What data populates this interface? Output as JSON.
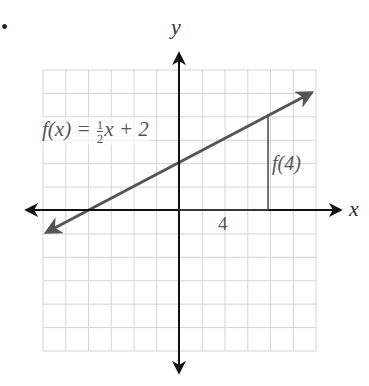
{
  "figure": {
    "bullet": "•",
    "axis_labels": {
      "x": "x",
      "y": "y"
    },
    "function_label": {
      "lhs": "f(x) = ",
      "frac_num": "1",
      "frac_den": "2",
      "rhs": "x + 2"
    },
    "value_label": "f(4)",
    "tick_label": "4",
    "colors": {
      "grid": "#d4d4d4",
      "axes": "#111111",
      "line": "#555555",
      "text": "#555555"
    }
  },
  "chart_data": {
    "type": "line",
    "title": "",
    "function": "f(x) = 1/2 x + 2",
    "xlabel": "x",
    "ylabel": "y",
    "xlim": [
      -6,
      6
    ],
    "ylim": [
      -6,
      6
    ],
    "grid": true,
    "series": [
      {
        "name": "f(x) = 1/2 x + 2",
        "x": [
          -6,
          6
        ],
        "y": [
          -1,
          5
        ]
      }
    ],
    "annotations": [
      {
        "text": "f(4)",
        "type": "vertical segment",
        "x": 4,
        "from_y": 0,
        "to_y": 4
      },
      {
        "text": "4",
        "type": "horizontal segment on x-axis",
        "from_x": 0,
        "to_x": 4
      }
    ]
  }
}
